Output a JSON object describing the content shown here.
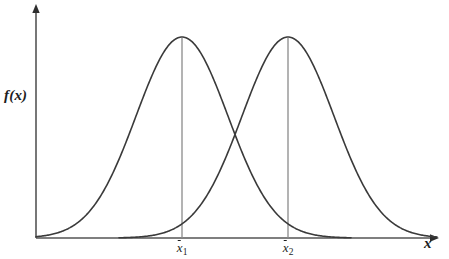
{
  "figure": {
    "background_color": "#ffffff",
    "curve_color": "#3a3a3a",
    "axis_color": "#555555",
    "mean_line_color": "#8a8a8a",
    "text_color": "#1d1d1d"
  },
  "axes": {
    "y_label": "f(x)",
    "x_label": "x",
    "origin_px": [
      36,
      238
    ],
    "x_axis_end_px": [
      437,
      238
    ],
    "y_axis_end_px": [
      36,
      8
    ]
  },
  "ticks": [
    {
      "name": "xbar1",
      "letter": "x",
      "subscript": "1",
      "x_px": 182
    },
    {
      "name": "xbar2",
      "letter": "x",
      "subscript": "2",
      "x_px": 288
    }
  ],
  "chart_data": {
    "type": "line",
    "title": "",
    "subtitle": "",
    "xlabel": "x",
    "ylabel": "f(x)",
    "grid": false,
    "legend": "none",
    "annotations": [
      "x̄1",
      "x̄2"
    ],
    "xlim": [
      36,
      437
    ],
    "ylim": [
      0,
      1
    ],
    "x": [
      36,
      56,
      76,
      96,
      116,
      136,
      156,
      176,
      196,
      216,
      236,
      256,
      276,
      296,
      316,
      336,
      356,
      376,
      396,
      416,
      437
    ],
    "series": [
      {
        "name": "distribution-1",
        "distribution": "normal",
        "mean_px": 182,
        "std_px": 46,
        "peak_px": [
          182,
          37
        ],
        "peak_value": 1.0,
        "values": [
          0.0,
          0.006,
          0.03,
          0.11,
          0.3,
          0.6,
          0.88,
          0.99,
          0.92,
          0.68,
          0.4,
          0.2,
          0.07,
          0.02,
          0.005,
          0.001,
          0.0,
          0.0,
          0.0,
          0.0,
          0.0
        ]
      },
      {
        "name": "distribution-2",
        "distribution": "normal",
        "mean_px": 288,
        "std_px": 46,
        "peak_px": [
          288,
          37
        ],
        "peak_value": 1.0,
        "values": [
          0.0,
          0.0,
          0.0,
          0.0,
          0.0,
          0.001,
          0.005,
          0.02,
          0.07,
          0.2,
          0.4,
          0.68,
          0.92,
          0.99,
          0.88,
          0.6,
          0.3,
          0.11,
          0.03,
          0.006,
          0.0
        ]
      }
    ],
    "intersection_px": [
      235,
      170
    ],
    "mean_lines": [
      {
        "name": "mean-line-1",
        "x_px": 182,
        "top_px": 37,
        "bottom_px": 238
      },
      {
        "name": "mean-line-2",
        "x_px": 288,
        "top_px": 37,
        "bottom_px": 238
      }
    ]
  }
}
